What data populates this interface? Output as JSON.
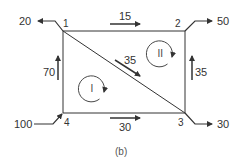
{
  "diagram": {
    "caption": "(b)",
    "nodes": [
      {
        "id": "1",
        "label": "1"
      },
      {
        "id": "2",
        "label": "2"
      },
      {
        "id": "3",
        "label": "3"
      },
      {
        "id": "4",
        "label": "4"
      }
    ],
    "external_flows": {
      "node1_out": "20",
      "node2_out": "50",
      "node3_out": "30",
      "node4_in": "100"
    },
    "pipe_flows": {
      "pipe_1_2": "15",
      "pipe_4_1": "70",
      "pipe_1_3": "35",
      "pipe_3_2": "35",
      "pipe_4_3": "30"
    },
    "loops": [
      {
        "id": "I",
        "label": "I"
      },
      {
        "id": "II",
        "label": "II"
      }
    ],
    "colors": {
      "line": "#333333",
      "text": "#333333"
    }
  }
}
